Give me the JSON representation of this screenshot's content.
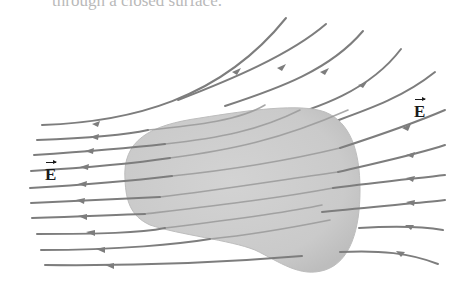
{
  "caption": "through a closed surface.",
  "labels": {
    "field_left": "E",
    "field_right": "E"
  },
  "colors": {
    "field_line": "#7d7d7d",
    "surface": "#c9c9c9",
    "surface_edge": "#bcbcbc",
    "label": "#1a1a1a",
    "background": "#ffffff"
  },
  "figure": {
    "field_line_count": 15
  }
}
